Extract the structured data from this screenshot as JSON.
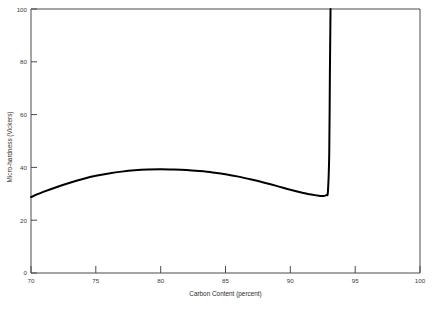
{
  "figure": {
    "name": "micro-hardness-vs-carbon-content",
    "background_color": "#ffffff",
    "line_color": "#000000",
    "axis_color": "#4a4a4a"
  },
  "chart_data": {
    "type": "line",
    "title": "",
    "subtitle": "",
    "xlabel": "Carbon Content (percent)",
    "ylabel": "Micro-hardness (Vickers)",
    "xlim": [
      70,
      100
    ],
    "ylim": [
      0,
      100
    ],
    "xticks": [
      70,
      75,
      80,
      85,
      90,
      95,
      100
    ],
    "xtick_labels": [
      "70",
      "75",
      "80",
      "85",
      "90",
      "95",
      "100"
    ],
    "yticks": [
      0,
      20,
      40,
      60,
      80,
      100
    ],
    "ytick_labels": [
      "0",
      "20",
      "40",
      "60",
      "80",
      "100"
    ],
    "grid": false,
    "legend": false,
    "legend_position": "none",
    "series": [
      {
        "name": "Micro-hardness",
        "x": [
          70.0,
          71.0,
          72.0,
          73.0,
          74.0,
          75.0,
          76.0,
          77.0,
          78.0,
          79.0,
          80.0,
          81.0,
          82.0,
          83.0,
          84.0,
          85.0,
          86.0,
          87.0,
          88.0,
          89.0,
          90.0,
          91.0,
          91.5,
          92.0,
          92.3,
          92.6,
          92.8,
          92.9,
          93.0,
          93.05,
          93.1
        ],
        "y": [
          28.8,
          30.8,
          32.6,
          34.2,
          35.6,
          36.8,
          37.7,
          38.4,
          38.9,
          39.2,
          39.3,
          39.2,
          39.0,
          38.6,
          38.1,
          37.4,
          36.5,
          35.4,
          34.2,
          32.9,
          31.5,
          30.3,
          29.8,
          29.4,
          29.2,
          29.2,
          29.6,
          31.0,
          45.0,
          75.0,
          100.0
        ]
      }
    ],
    "annotations": []
  },
  "axis": {
    "x_title": "Carbon Content (percent)",
    "y_title": "Micro-hardness (Vickers)"
  },
  "caption": {
    "sliver_text": ""
  }
}
